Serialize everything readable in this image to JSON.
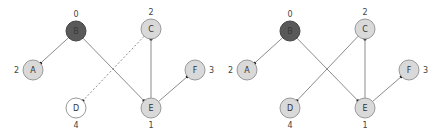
{
  "colors": {
    "source_fill": "#595959",
    "source_stroke": "#444444",
    "source_text": "#3a3a3a",
    "visited_fill": "#d9d9d9",
    "visited_stroke": "#999999",
    "unvisited_fill": "#ffffff",
    "unvisited_stroke": "#999999",
    "edge": "#8c8c8c",
    "arrow": "#222222"
  },
  "diagrams": [
    {
      "name": "left-graph",
      "offset_x": 0,
      "nodes": [
        {
          "id": "B",
          "label": "B",
          "dist": "0",
          "state": "source",
          "x": 76,
          "y": 31,
          "dist_pos": "top"
        },
        {
          "id": "A",
          "label": "A",
          "dist": "2",
          "state": "visited",
          "x": 33,
          "y": 70,
          "dist_pos": "left"
        },
        {
          "id": "C",
          "label": "C",
          "dist": "2",
          "state": "visited",
          "x": 151,
          "y": 29,
          "dist_pos": "top"
        },
        {
          "id": "D",
          "label": "D",
          "dist": "4",
          "state": "unvisited",
          "x": 76,
          "y": 108,
          "dist_pos": "bottom"
        },
        {
          "id": "E",
          "label": "E",
          "dist": "1",
          "state": "visited",
          "x": 151,
          "y": 108,
          "dist_pos": "bottom"
        },
        {
          "id": "F",
          "label": "F",
          "dist": "3",
          "state": "visited",
          "x": 195,
          "y": 70,
          "dist_pos": "right"
        }
      ],
      "edges": [
        {
          "from": "B",
          "to": "A",
          "style": "solid"
        },
        {
          "from": "B",
          "to": "E",
          "style": "solid"
        },
        {
          "from": "E",
          "to": "C",
          "style": "solid"
        },
        {
          "from": "E",
          "to": "F",
          "style": "solid"
        },
        {
          "from": "C",
          "to": "D",
          "style": "dashed"
        }
      ]
    },
    {
      "name": "right-graph",
      "offset_x": 214,
      "nodes": [
        {
          "id": "B",
          "label": "B",
          "dist": "0",
          "state": "source",
          "x": 76,
          "y": 31,
          "dist_pos": "top"
        },
        {
          "id": "A",
          "label": "A",
          "dist": "2",
          "state": "visited",
          "x": 33,
          "y": 70,
          "dist_pos": "left"
        },
        {
          "id": "C",
          "label": "C",
          "dist": "2",
          "state": "visited",
          "x": 151,
          "y": 29,
          "dist_pos": "top"
        },
        {
          "id": "D",
          "label": "D",
          "dist": "4",
          "state": "visited",
          "x": 76,
          "y": 108,
          "dist_pos": "bottom"
        },
        {
          "id": "E",
          "label": "E",
          "dist": "1",
          "state": "visited",
          "x": 151,
          "y": 108,
          "dist_pos": "bottom"
        },
        {
          "id": "F",
          "label": "F",
          "dist": "3",
          "state": "visited",
          "x": 195,
          "y": 70,
          "dist_pos": "right"
        }
      ],
      "edges": [
        {
          "from": "B",
          "to": "A",
          "style": "solid"
        },
        {
          "from": "B",
          "to": "E",
          "style": "solid"
        },
        {
          "from": "E",
          "to": "C",
          "style": "solid"
        },
        {
          "from": "E",
          "to": "F",
          "style": "solid"
        },
        {
          "from": "C",
          "to": "D",
          "style": "solid"
        }
      ]
    }
  ]
}
